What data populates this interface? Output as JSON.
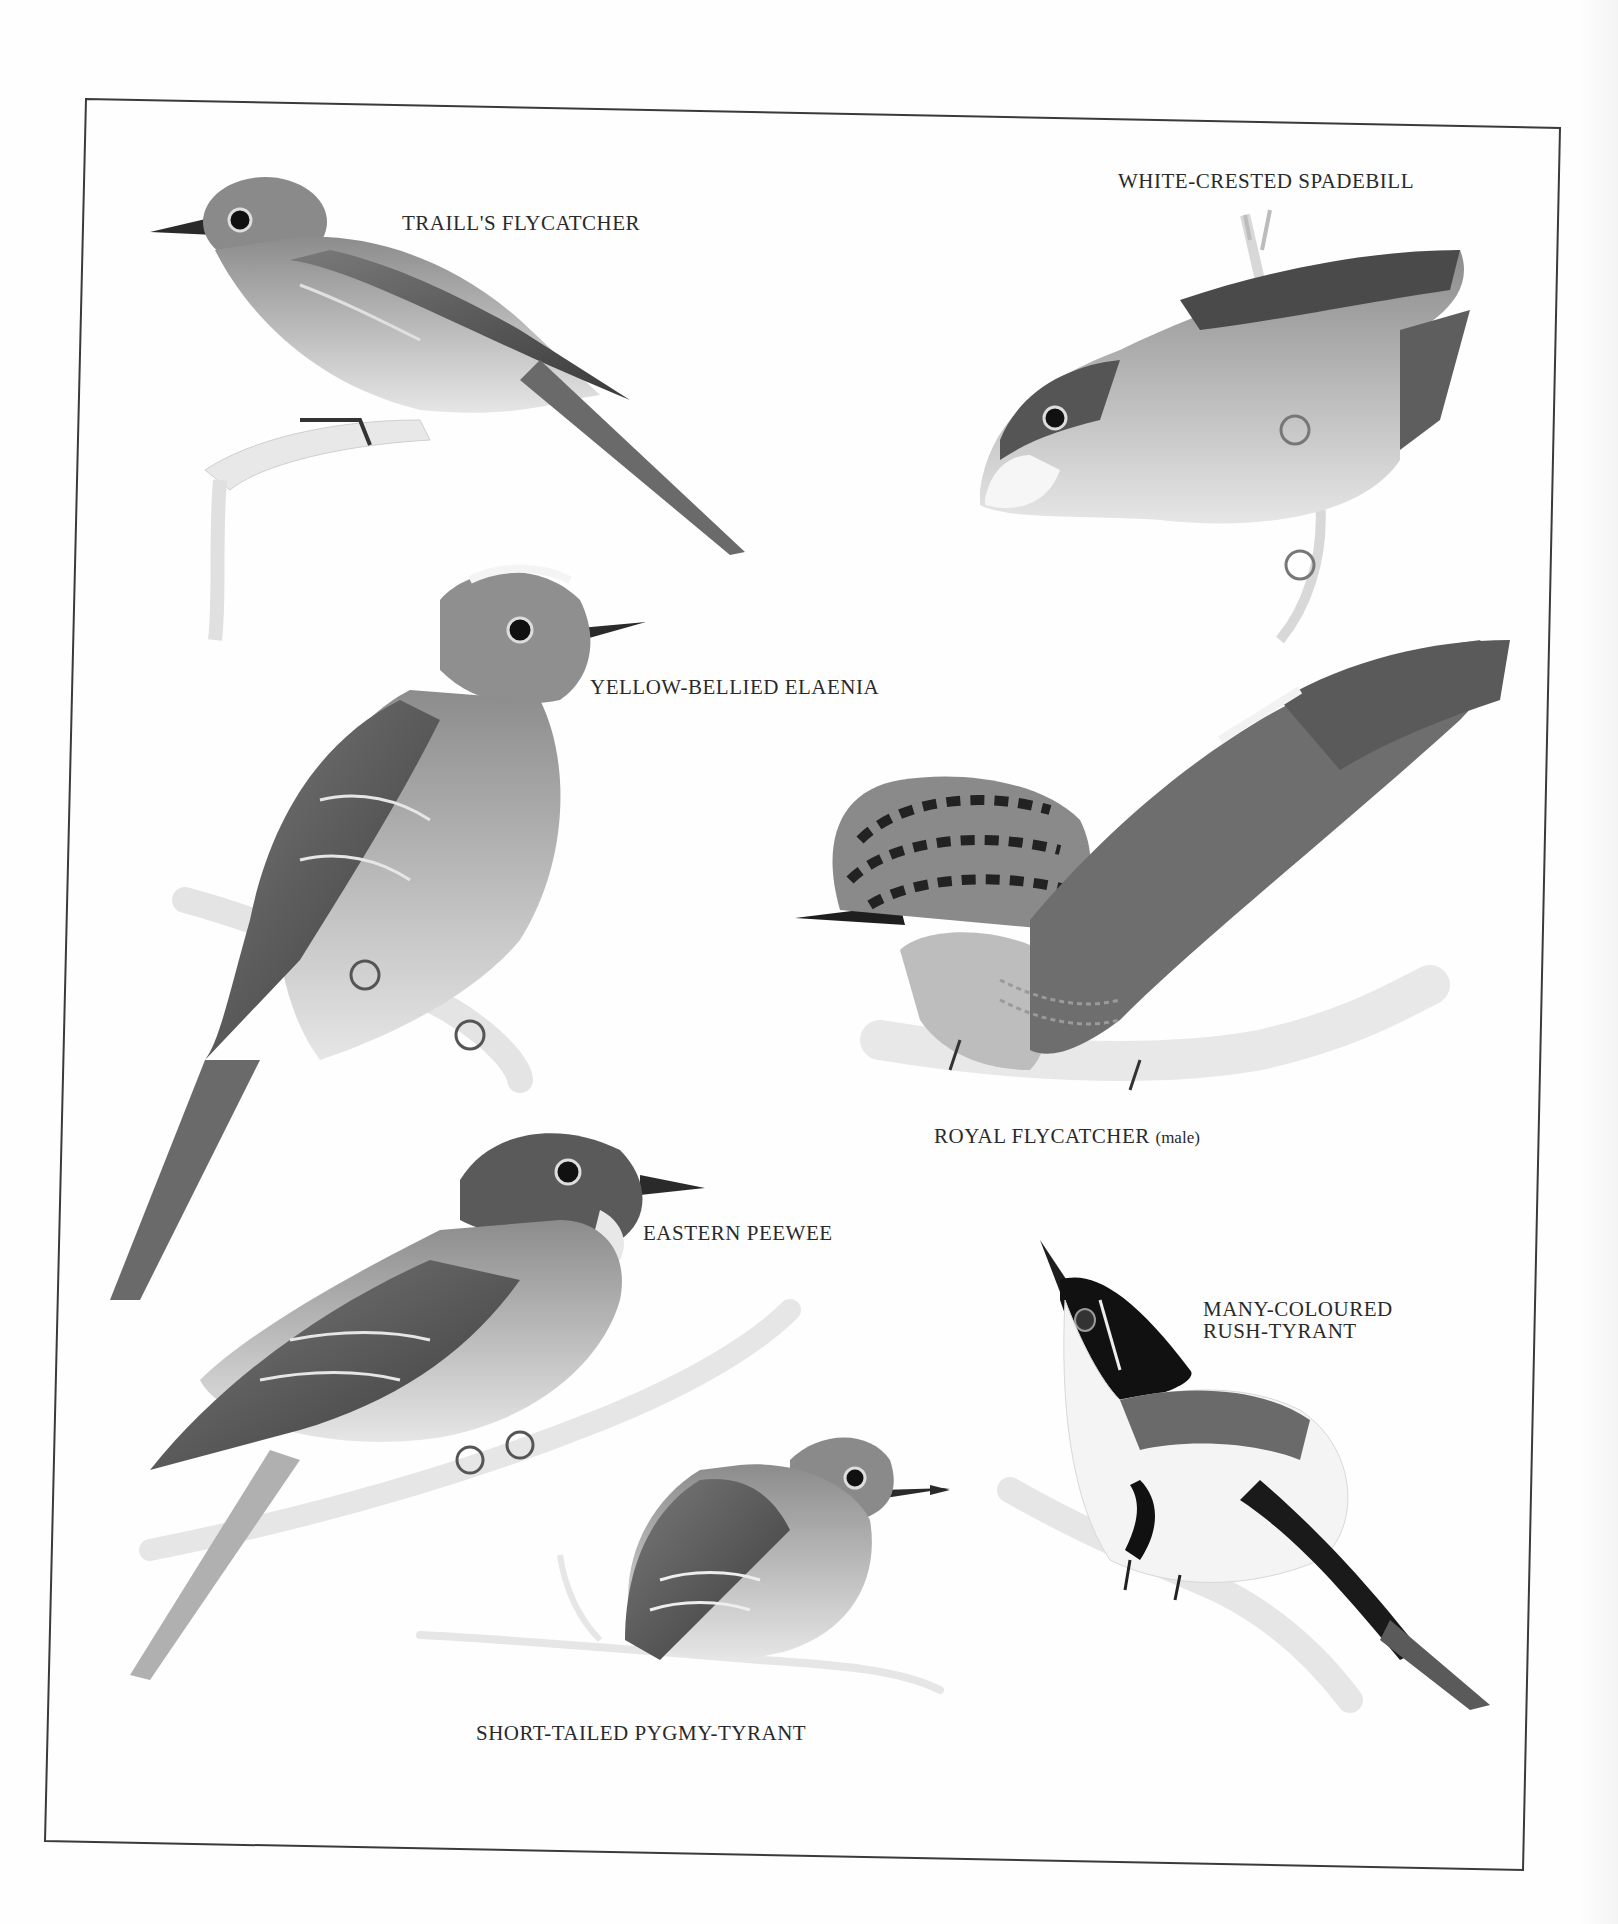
{
  "plate": {
    "frame_color": "#3a3a3a",
    "background": "#fefefe",
    "labels": {
      "traills_flycatcher": "TRAILL'S FLYCATCHER",
      "white_crested_spadebill": "WHITE-CRESTED SPADEBILL",
      "yellow_bellied_elaenia": "YELLOW-BELLIED ELAENIA",
      "royal_flycatcher": "ROYAL FLYCATCHER",
      "royal_flycatcher_note": "(male)",
      "eastern_peewee": "EASTERN PEEWEE",
      "many_coloured_line1": "MANY-COLOURED",
      "many_coloured_line2": "RUSH-TYRANT",
      "short_tailed_pygmy_tyrant": "SHORT-TAILED PYGMY-TYRANT"
    }
  }
}
